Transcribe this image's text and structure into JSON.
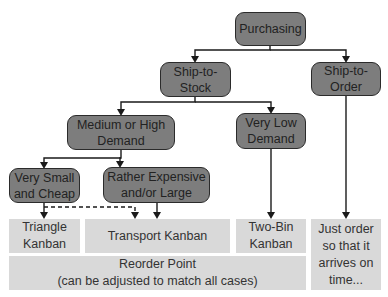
{
  "diagram": {
    "nodes": {
      "purchasing": "Purchasing",
      "ship_to_stock": "Ship-to-\nStock",
      "ship_to_order": "Ship-to-\nOrder",
      "medium_high_demand": "Medium or High\nDemand",
      "very_low_demand": "Very Low\nDemand",
      "very_small_cheap": "Very Small\nand Cheap",
      "rather_expensive_large": "Rather Expensive\nand/or Large"
    },
    "outcomes": {
      "triangle_kanban": "Triangle\nKanban",
      "transport_kanban": "Transport Kanban",
      "two_bin_kanban": "Two-Bin\nKanban",
      "just_order": "Just order\nso that it\narrives on\ntime...",
      "reorder_point": "Reorder Point\n(can be adjusted to match all cases)"
    },
    "colors": {
      "decision_fill": "#7d7d7d",
      "decision_border": "#2b2b2b",
      "outcome_fill": "#d9d9d9",
      "line": "#1a1a1a"
    }
  }
}
